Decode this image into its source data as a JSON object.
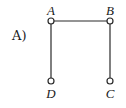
{
  "option": {
    "label": "A)"
  },
  "graph": {
    "nodes": [
      {
        "id": "A",
        "label": "A",
        "x": 51,
        "y": 21,
        "label_x": 51,
        "label_y": 15
      },
      {
        "id": "B",
        "label": "B",
        "x": 110,
        "y": 21,
        "label_x": 110,
        "label_y": 15
      },
      {
        "id": "C",
        "label": "C",
        "x": 110,
        "y": 81,
        "label_x": 110,
        "label_y": 98
      },
      {
        "id": "D",
        "label": "D",
        "x": 51,
        "y": 81,
        "label_x": 51,
        "label_y": 98
      }
    ],
    "edges": [
      {
        "from": "A",
        "to": "B"
      },
      {
        "from": "A",
        "to": "D"
      },
      {
        "from": "B",
        "to": "C"
      }
    ]
  },
  "colors": {
    "stroke": "#2a2a2a",
    "text": "#1a1a1a",
    "background": "#ffffff"
  }
}
